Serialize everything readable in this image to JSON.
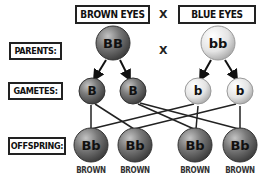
{
  "header": {
    "left_trait": "BROWN EYES",
    "cross_symbol": "X",
    "right_trait": "BLUE EYES"
  },
  "rows": {
    "parents_label": "PARENTS:",
    "gametes_label": "GAMETES:",
    "offspring_label": "OFFSPRING:"
  },
  "parents": [
    {
      "genotype": "BB",
      "shade": "dark"
    },
    {
      "genotype": "bb",
      "shade": "light"
    }
  ],
  "parents_cross_symbol": "X",
  "gametes": [
    {
      "allele": "B",
      "shade": "dark"
    },
    {
      "allele": "B",
      "shade": "dark"
    },
    {
      "allele": "b",
      "shade": "light"
    },
    {
      "allele": "b",
      "shade": "light"
    }
  ],
  "offspring": [
    {
      "genotype": "Bb",
      "phenotype": "BROWN"
    },
    {
      "genotype": "Bb",
      "phenotype": "BROWN"
    },
    {
      "genotype": "Bb",
      "phenotype": "BROWN"
    },
    {
      "genotype": "Bb",
      "phenotype": "BROWN"
    }
  ],
  "colors": {
    "dark_sphere": "#6e6e6e",
    "light_sphere": "#e6e6e6",
    "line": "#222222"
  }
}
